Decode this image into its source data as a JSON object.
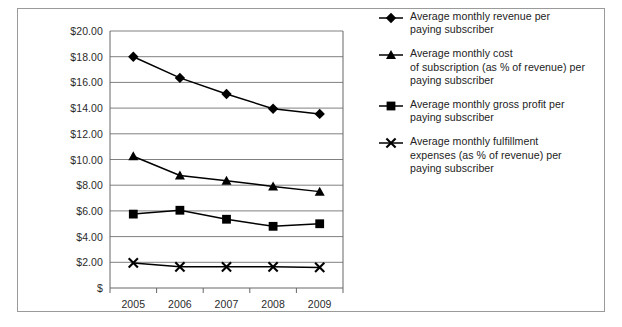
{
  "chart_data": {
    "type": "line",
    "title": "",
    "subtitle": "",
    "xlabel": "",
    "ylabel": "",
    "categories": [
      "2005",
      "2006",
      "2007",
      "2008",
      "2009"
    ],
    "x_tick_labels": [
      "2005",
      "2006",
      "2007",
      "2008",
      "2009"
    ],
    "y_tick_labels": [
      "$20.00",
      "$18.00",
      "$16.00",
      "$14.00",
      "$12.00",
      "$10.00",
      "$8.00",
      "$6.00",
      "$4.00",
      "$2.00",
      "$"
    ],
    "y_tick_values": [
      20,
      18,
      16,
      14,
      12,
      10,
      8,
      6,
      4,
      2,
      0
    ],
    "ylim": [
      0,
      20
    ],
    "grid": true,
    "grid_axis": "y",
    "legend_position": "right",
    "line_color": "#000000",
    "grid_color": "#808080",
    "axis_color": "#666666",
    "series": [
      {
        "name": "Average monthly revenue per paying subscriber",
        "marker": "diamond",
        "values": [
          18.0,
          16.35,
          15.1,
          13.95,
          13.55
        ]
      },
      {
        "name": "Average monthly cost of subscription (as % of revenue) per paying subscriber",
        "marker": "triangle",
        "values": [
          10.25,
          8.75,
          8.35,
          7.9,
          7.5
        ]
      },
      {
        "name": "Average monthly gross profit per paying subscriber",
        "marker": "square",
        "values": [
          5.75,
          6.05,
          5.35,
          4.8,
          5.0
        ]
      },
      {
        "name": "Average monthly fulfillment expenses (as % of revenue) per paying subscriber",
        "marker": "x",
        "values": [
          1.95,
          1.65,
          1.65,
          1.65,
          1.6
        ]
      }
    ]
  },
  "legend": {
    "items": [
      {
        "marker": "diamond",
        "lines": [
          "Average monthly revenue per",
          "paying subscriber"
        ]
      },
      {
        "marker": "triangle",
        "lines": [
          "Average monthly cost",
          "of subscription (as % of revenue) per",
          "paying subscriber"
        ]
      },
      {
        "marker": "square",
        "lines": [
          "Average monthly gross profit per",
          "paying subscriber"
        ]
      },
      {
        "marker": "x",
        "lines": [
          "Average monthly fulfillment",
          "expenses (as % of revenue) per",
          "paying subscriber"
        ]
      }
    ]
  }
}
